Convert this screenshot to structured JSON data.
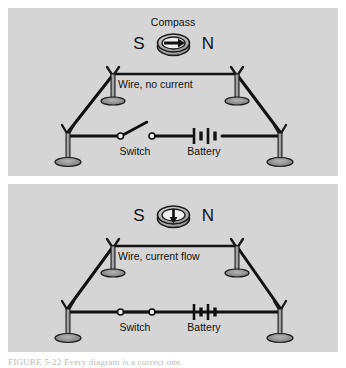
{
  "figure": {
    "caption": "FIGURE 5-22  Every diagram is a correct one."
  },
  "panels": [
    {
      "id": "no-current",
      "compass": {
        "title": "Compass",
        "west_label": "S",
        "east_label": "N",
        "needle_direction": "east",
        "needle_glyph": "→"
      },
      "wire_label": "Wire, no current",
      "switch": {
        "label": "Switch",
        "state": "open"
      },
      "battery": {
        "label": "Battery",
        "cells": 2
      },
      "posts": 4
    },
    {
      "id": "current-flow",
      "compass": {
        "title": "",
        "west_label": "S",
        "east_label": "N",
        "needle_direction": "south",
        "needle_glyph": "↓"
      },
      "wire_label": "Wire, current flow",
      "switch": {
        "label": "Switch",
        "state": "closed"
      },
      "battery": {
        "label": "Battery",
        "cells": 2
      },
      "posts": 4
    }
  ],
  "colors": {
    "page_background": "#ffffff",
    "panel_background": "#d5d5d5",
    "ink": "#111111",
    "post_fill": "#8d8d8d",
    "post_stroke": "#1a1a1a",
    "base_fill": "#9a9a9a",
    "compass_body": "#c0c0c0",
    "compass_rim": "#1a1a1a",
    "caption_text": "#b9b9b9"
  }
}
